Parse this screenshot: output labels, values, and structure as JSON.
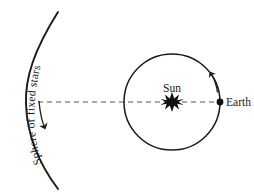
{
  "diagram": {
    "title_present": false,
    "background_color": "#ffffff",
    "ink_color": "#1a1a1a",
    "labels": {
      "sphere_of_fixed_stars": "Sphere of fixed stars",
      "sun": "Sun",
      "earth": "Earth"
    },
    "elements": {
      "sphere_arc": {
        "name": "sphere-of-fixed-stars-arc",
        "stroke_color": "#1a1a1a",
        "stroke_width": 1.8
      },
      "orbit_circle": {
        "name": "earth-orbit-circle",
        "center_x": 172,
        "center_y": 102,
        "radius": 48,
        "stroke_color": "#1a1a1a",
        "stroke_width": 1.5
      },
      "sun_marker": {
        "name": "sun-starburst",
        "x": 172,
        "y": 102,
        "points": 8,
        "fill": "#111111"
      },
      "earth_marker": {
        "name": "earth-dot",
        "x": 220,
        "y": 102,
        "radius": 3.4,
        "fill": "#111111"
      },
      "axis_line": {
        "name": "sun-earth-dashed-axis",
        "x1": 38,
        "y1": 102,
        "x2": 222,
        "y2": 102,
        "dash": "5 4",
        "stroke_color": "#555555"
      },
      "sphere_rotation_arrow": {
        "name": "sphere-rotation-arrow",
        "direction": "downward"
      },
      "earth_orbit_arrow": {
        "name": "earth-orbit-direction-arrow",
        "direction": "counterclockwise"
      }
    }
  }
}
